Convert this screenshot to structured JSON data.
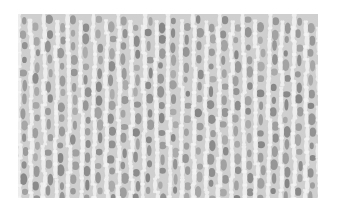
{
  "image": {
    "subject": "knitted fabric texture",
    "palette": {
      "background": "#ffffff",
      "base": "#cfcfcf",
      "highlight": "#f4f4f4",
      "shadow": "#6e6e6e"
    },
    "columns": 24,
    "rows": 14
  }
}
